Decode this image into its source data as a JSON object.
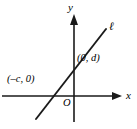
{
  "figure": {
    "type": "coordinate-plane-line-graph",
    "width": 137,
    "height": 129,
    "background_color": "#ffffff",
    "stroke_color": "#1a1a1a",
    "axes": {
      "x_axis_label": "x",
      "y_axis_label": "y",
      "origin_label": "O",
      "x_axis_y_pixel": 96,
      "y_axis_x_pixel": 74,
      "x_axis_has_arrow": true,
      "y_axis_has_arrow": true
    },
    "line": {
      "label": "ℓ",
      "from_pixel": [
        37,
        118
      ],
      "to_pixel": [
        105,
        30
      ],
      "y_intercept_pixel": [
        74,
        58
      ],
      "x_intercept_pixel": [
        47,
        96
      ]
    },
    "points": [
      {
        "name": "y-intercept",
        "label": "(0, d)",
        "algebraic_x": "0",
        "algebraic_y": "d"
      },
      {
        "name": "x-intercept",
        "label": "(–c, 0)",
        "algebraic_x": "–c",
        "algebraic_y": "0"
      }
    ]
  }
}
